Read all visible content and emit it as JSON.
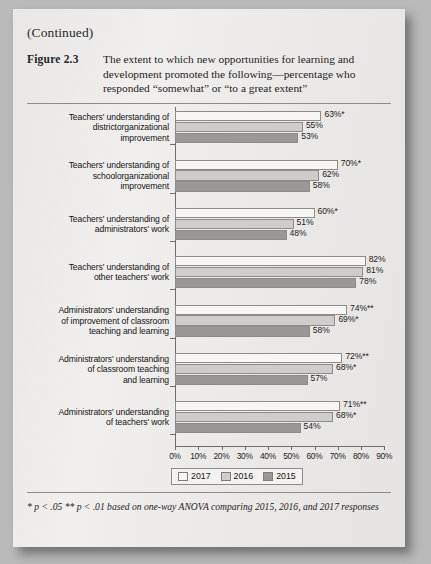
{
  "page": {
    "continued_label": "(Continued)",
    "figure_number": "Figure 2.3",
    "figure_caption": "The extent to which new opportunities for learning and development promoted the following—percentage who responded “somewhat” or “to a great extent”",
    "footnote": "* p < .05 ** p < .01 based on one-way ANOVA comparing 2015, 2016, and 2017 responses"
  },
  "colors": {
    "series_2017": "#f7f6f5",
    "series_2016": "#cfcdcc",
    "series_2015": "#9a9897",
    "bar_border": "#8d8b8b",
    "axis": "#6f6d6d",
    "page_background": "#eceaea"
  },
  "chart_data": {
    "type": "bar",
    "orientation": "horizontal",
    "title": "The extent to which new opportunities for learning and development promoted the following—percentage who responded “somewhat” or “to a great extent”",
    "xlabel": "",
    "ylabel": "",
    "xlim": [
      0,
      90
    ],
    "grid": false,
    "legend_position": "bottom",
    "xticks": [
      "0%",
      "10%",
      "20%",
      "30%",
      "40%",
      "50%",
      "60%",
      "70%",
      "80%",
      "90%"
    ],
    "xtick_values": [
      0,
      10,
      20,
      30,
      40,
      50,
      60,
      70,
      80,
      90
    ],
    "categories": [
      "Teachers' understanding of districtorganizational improvement",
      "Teachers' understanding of schoolorganizational improvement",
      "Teachers' understanding of administrators' work",
      "Teachers' understanding of other teachers' work",
      "Administrators' understanding of improvement of classroom teaching and learning",
      "Administrators' understanding of classroom teaching and learning",
      "Administrators' understanding of teachers' work"
    ],
    "series": [
      {
        "name": "2017",
        "values": [
          63,
          70,
          60,
          82,
          74,
          72,
          71
        ]
      },
      {
        "name": "2016",
        "values": [
          55,
          62,
          51,
          81,
          69,
          68,
          68
        ]
      },
      {
        "name": "2015",
        "values": [
          53,
          58,
          48,
          78,
          58,
          57,
          54
        ]
      }
    ],
    "data_labels": [
      {
        "category_index": 0,
        "labels": [
          "63%*",
          "55%",
          "53%"
        ]
      },
      {
        "category_index": 1,
        "labels": [
          "70%*",
          "62%",
          "58%"
        ]
      },
      {
        "category_index": 2,
        "labels": [
          "60%*",
          "51%",
          "48%"
        ]
      },
      {
        "category_index": 3,
        "labels": [
          "82%",
          "81%",
          "78%"
        ]
      },
      {
        "category_index": 4,
        "labels": [
          "74%**",
          "69%*",
          "58%"
        ]
      },
      {
        "category_index": 5,
        "labels": [
          "72%**",
          "68%*",
          "57%"
        ]
      },
      {
        "category_index": 6,
        "labels": [
          "71%**",
          "68%*",
          "54%"
        ]
      }
    ],
    "legend": [
      "2017",
      "2016",
      "2015"
    ]
  },
  "category_label_lines": [
    [
      "Teachers' understanding of",
      "districtorganizational",
      "improvement"
    ],
    [
      "Teachers' understanding of",
      "schoolorganizational",
      "improvement"
    ],
    [
      "Teachers' understanding of",
      "administrators' work"
    ],
    [
      "Teachers' understanding of",
      "other teachers' work"
    ],
    [
      "Administrators' understanding",
      "of improvement of classroom",
      "teaching and learning"
    ],
    [
      "Administrators' understanding",
      "of classroom teaching",
      "and learning"
    ],
    [
      "Administrators' understanding",
      "of teachers' work"
    ]
  ]
}
